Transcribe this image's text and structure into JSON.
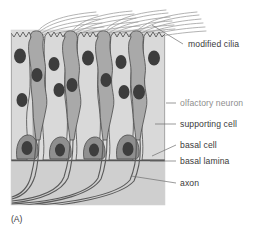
{
  "figure": {
    "caption": "(A)",
    "panel": {
      "background_color": "#dcdcdc",
      "x": 11,
      "y": 30,
      "width": 154,
      "height": 175
    },
    "palette": {
      "supporting_cell": "#d9d9d9",
      "olfactory_neuron": "#a9a9a9",
      "basal_cell": "#8f8f8f",
      "nucleus": "#3d3d3d",
      "outline": "#4a4a4a",
      "cilia_line": "#9a9a9a",
      "axon_line": "#5a5a5a",
      "basal_lamina": "#555555",
      "lamina_space": "#cfcfcf",
      "label_text": "#3a3a3a",
      "label_text_muted": "#8e8e8e",
      "leader_line": "#6e6e6e"
    },
    "labels": [
      {
        "id": "modified-cilia",
        "text": "modified cilia",
        "text_x": 188,
        "text_y": 47,
        "muted": false,
        "leader": "M 183 44 L 152 25"
      },
      {
        "id": "olfactory-neuron",
        "text": "olfactory neuron",
        "text_x": 180,
        "text_y": 106,
        "muted": true,
        "leader": "M 176 103 L 166 103"
      },
      {
        "id": "supporting-cell",
        "text": "supporting cell",
        "text_x": 180,
        "text_y": 127,
        "muted": false,
        "leader": "M 176 124 L 155 124"
      },
      {
        "id": "basal-cell",
        "text": "basal cell",
        "text_x": 180,
        "text_y": 148,
        "muted": false,
        "leader": "M 176 145 L 152 156"
      },
      {
        "id": "basal-lamina",
        "text": "basal lamina",
        "text_x": 180,
        "text_y": 164,
        "muted": false,
        "leader": "M 176 161 L 150 161"
      },
      {
        "id": "axon",
        "text": "axon",
        "text_x": 180,
        "text_y": 186,
        "muted": false,
        "leader": "M 176 183 L 131 176"
      }
    ],
    "structures": {
      "supporting_cell_count": 5,
      "olfactory_neuron_count": 4,
      "basal_cell_count": 4,
      "cilia_bundles": 4,
      "axon_count": 4
    }
  }
}
